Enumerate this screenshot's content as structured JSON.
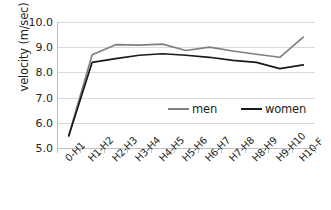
{
  "chart_data": {
    "type": "line",
    "title": "",
    "xlabel": "",
    "ylabel": "velocity (m/sec)",
    "categories": [
      "0-H1",
      "H1-H2",
      "H2-H3",
      "H3-H4",
      "H4-H5",
      "H5-H6",
      "H6-H7",
      "H7-H8",
      "H8-H9",
      "H9-H10",
      "H10-F"
    ],
    "ylim": [
      5.0,
      10.0
    ],
    "yticks": [
      "5.0",
      "6.0",
      "7.0",
      "8.0",
      "9.0",
      "10.0"
    ],
    "ytick_values": [
      5.0,
      6.0,
      7.0,
      8.0,
      9.0,
      10.0
    ],
    "grid": true,
    "legend_position": "center",
    "series": [
      {
        "name": "men",
        "color": "#7f7f7f",
        "values": [
          5.5,
          8.7,
          9.1,
          9.08,
          9.12,
          8.87,
          9.0,
          8.85,
          8.72,
          8.6,
          9.4
        ]
      },
      {
        "name": "women",
        "color": "#1a1a1a",
        "values": [
          5.48,
          8.4,
          8.55,
          8.68,
          8.74,
          8.68,
          8.6,
          8.48,
          8.4,
          8.15,
          8.3
        ]
      }
    ]
  },
  "axis": {
    "y_title": "velocity (m/sec)"
  },
  "legend": {
    "items": [
      {
        "label": "men"
      },
      {
        "label": "women"
      }
    ]
  },
  "colors": {
    "men": "#7f7f7f",
    "women": "#1a1a1a",
    "grid": "#d9d9d9",
    "axis": "#bfbfbf",
    "text": "#231f20",
    "background": "#ffffff"
  }
}
